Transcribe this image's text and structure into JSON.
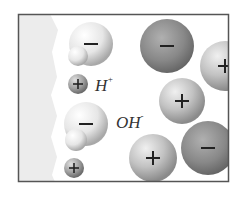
{
  "diagram": {
    "frame": {
      "x": 18,
      "y": 14,
      "width": 211,
      "height": 168,
      "stroke": "#555555"
    },
    "surface": {
      "fill": "#ececec"
    },
    "labels": [
      {
        "id": "h-plus",
        "base": "H",
        "sup": "+",
        "x": 95,
        "y": 77
      },
      {
        "id": "oh-minus",
        "base": "OH",
        "sup": "-",
        "x": 116,
        "y": 114
      }
    ],
    "adsorbed_ions": [
      {
        "name": "water-oxygen-1",
        "cx": 91,
        "cy": 44,
        "r": 22,
        "sign": "−",
        "color": "#f2f2f2"
      },
      {
        "name": "water-hydrogen-1",
        "cx": 78,
        "cy": 56,
        "r": 10,
        "sign": "",
        "color": "#f7f7f7"
      },
      {
        "name": "h-plus-ion",
        "cx": 78,
        "cy": 84,
        "r": 10,
        "sign": "+",
        "color": "#b0b0b0"
      },
      {
        "name": "water-oxygen-2",
        "cx": 86,
        "cy": 124,
        "r": 22,
        "sign": "−",
        "color": "#f2f2f2"
      },
      {
        "name": "water-hydrogen-2",
        "cx": 76,
        "cy": 140,
        "r": 11,
        "sign": "",
        "color": "#f7f7f7"
      },
      {
        "name": "plus-ion-small",
        "cx": 74,
        "cy": 168,
        "r": 10,
        "sign": "+",
        "color": "#b0b0b0"
      }
    ],
    "solution_ions": [
      {
        "name": "anion-1",
        "cx": 167,
        "cy": 46,
        "r": 27,
        "sign": "−",
        "color": "#8a8a8a"
      },
      {
        "name": "cation-1",
        "cx": 225,
        "cy": 66,
        "r": 25,
        "sign": "+",
        "color": "#d0d0d0"
      },
      {
        "name": "cation-2",
        "cx": 182,
        "cy": 101,
        "r": 23,
        "sign": "+",
        "color": "#c4c4c4"
      },
      {
        "name": "cation-3",
        "cx": 153,
        "cy": 158,
        "r": 24,
        "sign": "+",
        "color": "#c4c4c4"
      },
      {
        "name": "anion-2",
        "cx": 208,
        "cy": 148,
        "r": 27,
        "sign": "−",
        "color": "#8a8a8a"
      }
    ]
  }
}
